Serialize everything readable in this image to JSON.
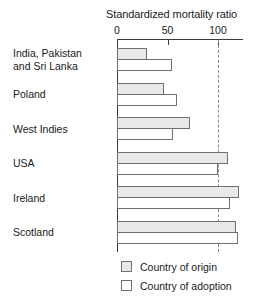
{
  "chart_data": {
    "type": "bar",
    "orientation": "horizontal",
    "title": "Standardized mortality ratio",
    "xlabel": "",
    "ylabel": "",
    "xlim": [
      0,
      125
    ],
    "axis_ticks": [
      0,
      50,
      100
    ],
    "axis_tick_labels": [
      "0",
      "50",
      "100"
    ],
    "reference_line": 100,
    "grid": false,
    "legend_position": "bottom",
    "categories": [
      "India, Pakistan\nand Sri Lanka",
      "Poland",
      "West Indies",
      "USA",
      "Ireland",
      "Scotland"
    ],
    "series": [
      {
        "name": "Country of origin",
        "values": [
          30,
          47,
          72,
          110,
          121,
          118
        ]
      },
      {
        "name": "Country of adoption",
        "values": [
          54,
          59,
          55,
          100,
          112,
          120
        ]
      }
    ]
  },
  "colors": {
    "origin_fill": "#e8e8e8",
    "adoption_fill": "#ffffff",
    "bar_border": "#707070",
    "axis": "#3a3a3a",
    "reference_line": "#8a8a8a",
    "text": "#1a1a1a",
    "background": "#ffffff"
  },
  "legend": {
    "items": [
      {
        "label": "Country of origin",
        "swatch": "origin"
      },
      {
        "label": "Country of adoption",
        "swatch": "adoption"
      }
    ]
  }
}
